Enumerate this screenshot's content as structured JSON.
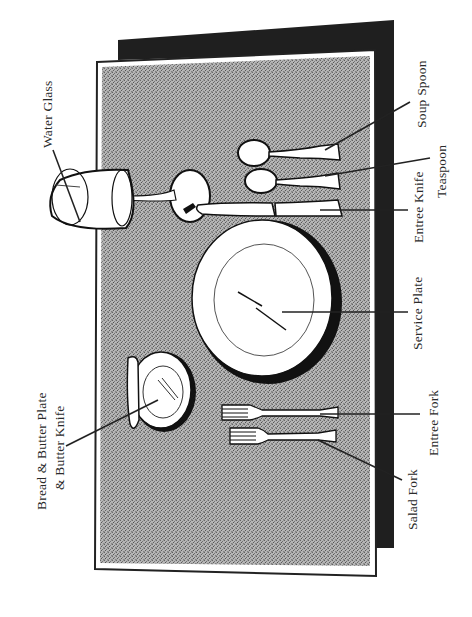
{
  "diagram": {
    "colors": {
      "background": "#ffffff",
      "backdrop": "#1f1f1f",
      "tablecloth": "#9a9a9a",
      "tablecloth_border": "#222222",
      "item_fill": "#ffffff",
      "outline": "#111111",
      "leader_line": "#222222",
      "label_text": "#2a2a2a"
    },
    "labels": {
      "water_glass": "Water Glass",
      "soup_spoon": "Soup Spoon",
      "teaspoon": "Teaspoon",
      "entree_knife": "Entree Knife",
      "service_plate": "Service Plate",
      "entree_fork": "Entree Fork",
      "salad_fork": "Salad Fork",
      "bread_butter_line1": "Bread & Butter Plate",
      "bread_butter_line2": "& Butter Knife"
    }
  }
}
